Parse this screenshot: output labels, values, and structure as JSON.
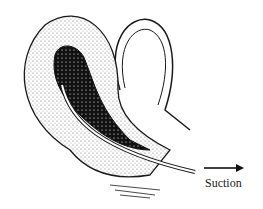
{
  "figure": {
    "arrow_label": "Suction",
    "colors": {
      "ink": "#1a1a1a",
      "stipple": "#9a9a9a",
      "background": "#ffffff"
    }
  }
}
